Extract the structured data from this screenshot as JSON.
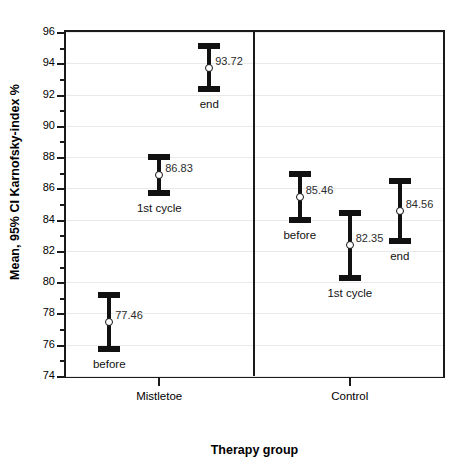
{
  "chart_data": {
    "type": "scatter",
    "title": "",
    "xlabel": "Therapy group",
    "ylabel": "Mean, 95% CI Karnofsky-index %",
    "ylim": [
      74,
      96
    ],
    "ytick_step": 2,
    "yticks": [
      74,
      76,
      78,
      80,
      82,
      84,
      86,
      88,
      90,
      92,
      94,
      96
    ],
    "minor_tick_step": 1,
    "grid": true,
    "legend": "none",
    "groups": [
      "Mistletoe",
      "Control"
    ],
    "categories": [
      "before",
      "1st cycle",
      "end"
    ],
    "series": [
      {
        "name": "Mistletoe",
        "points": [
          {
            "label": "before",
            "mean": 77.46,
            "mean_text": "77.46",
            "ci_low": 75.55,
            "ci_high": 79.38
          },
          {
            "label": "1st cycle",
            "mean": 86.83,
            "mean_text": "86.83",
            "ci_low": 85.48,
            "ci_high": 88.18
          },
          {
            "label": "end",
            "mean": 93.72,
            "mean_text": "93.72",
            "ci_low": 92.14,
            "ci_high": 95.3
          }
        ]
      },
      {
        "name": "Control",
        "points": [
          {
            "label": "before",
            "mean": 85.46,
            "mean_text": "85.46",
            "ci_low": 83.78,
            "ci_high": 87.14
          },
          {
            "label": "1st cycle",
            "mean": 82.35,
            "mean_text": "82.35",
            "ci_low": 80.05,
            "ci_high": 84.6
          },
          {
            "label": "end",
            "mean": 84.56,
            "mean_text": "84.56",
            "ci_low": 82.45,
            "ci_high": 86.66
          }
        ]
      }
    ]
  }
}
